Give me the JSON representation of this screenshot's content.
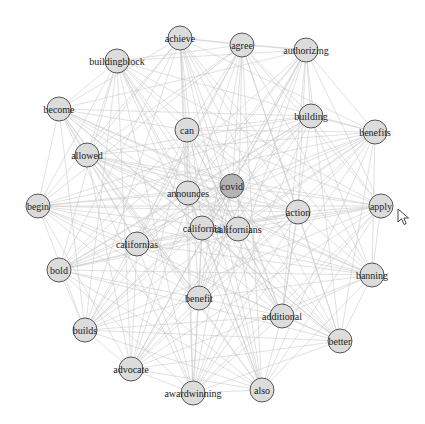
{
  "graph": {
    "title": "Word co-occurrence network",
    "node_radius": 12,
    "colors": {
      "node_fill": "#dcdcdc",
      "node_fill_highlight": "#b4b4b4",
      "node_stroke": "#555555",
      "edge": "#c4c4c4",
      "label": "#222222"
    },
    "nodes": [
      {
        "id": "achieve",
        "label": "achieve",
        "x": 180,
        "y": 38
      },
      {
        "id": "agree",
        "label": "agree",
        "x": 242,
        "y": 45
      },
      {
        "id": "authorizing",
        "label": "authorizing",
        "x": 306,
        "y": 50
      },
      {
        "id": "buildingblock",
        "label": "buildingblock",
        "x": 117,
        "y": 61
      },
      {
        "id": "become",
        "label": "become",
        "x": 59,
        "y": 109
      },
      {
        "id": "can",
        "label": "can",
        "x": 187,
        "y": 130
      },
      {
        "id": "building",
        "label": "building",
        "x": 311,
        "y": 116
      },
      {
        "id": "benefits",
        "label": "benefits",
        "x": 375,
        "y": 132
      },
      {
        "id": "allowed",
        "label": "allowed",
        "x": 87,
        "y": 155
      },
      {
        "id": "covid",
        "label": "covid",
        "x": 232,
        "y": 186,
        "highlight": true
      },
      {
        "id": "announces",
        "label": "announces",
        "x": 188,
        "y": 193
      },
      {
        "id": "begin",
        "label": "begin",
        "x": 38,
        "y": 206
      },
      {
        "id": "action",
        "label": "action",
        "x": 298,
        "y": 212
      },
      {
        "id": "apply",
        "label": "apply",
        "x": 381,
        "y": 206
      },
      {
        "id": "california",
        "label": "california",
        "x": 202,
        "y": 228
      },
      {
        "id": "californians",
        "label": "californians",
        "x": 238,
        "y": 229
      },
      {
        "id": "californias",
        "label": "californias",
        "x": 137,
        "y": 244
      },
      {
        "id": "bold",
        "label": "bold",
        "x": 59,
        "y": 270
      },
      {
        "id": "banning",
        "label": "banning",
        "x": 372,
        "y": 275
      },
      {
        "id": "benefit",
        "label": "benefit",
        "x": 199,
        "y": 298
      },
      {
        "id": "additional",
        "label": "additional",
        "x": 282,
        "y": 316
      },
      {
        "id": "builds",
        "label": "builds",
        "x": 85,
        "y": 330
      },
      {
        "id": "better",
        "label": "better",
        "x": 340,
        "y": 341
      },
      {
        "id": "advocate",
        "label": "advocate",
        "x": 131,
        "y": 369
      },
      {
        "id": "awardwinning",
        "label": "awardwinning",
        "x": 193,
        "y": 393
      },
      {
        "id": "also",
        "label": "also",
        "x": 262,
        "y": 390
      }
    ],
    "edge_density": "dense, near-complete graph"
  },
  "cursor": {
    "type": "arrow-pointer",
    "x": 397,
    "y": 208
  }
}
